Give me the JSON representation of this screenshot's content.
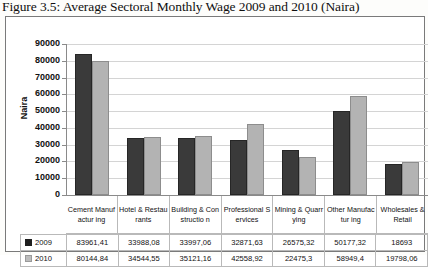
{
  "caption": "Figure 3.5: Average Sectoral Monthly Wage 2009 and 2010 (Naira)",
  "chart_data": {
    "type": "bar",
    "title": "Average Sectoral Monthly Wage 2009 and 2010 (Naira)",
    "xlabel": "",
    "ylabel": "Naira",
    "ylim": [
      0,
      90000
    ],
    "ytick_labels": [
      "90000",
      "80000",
      "70000",
      "60000",
      "50000",
      "40000",
      "30000",
      "20000",
      "10000",
      "0"
    ],
    "ytick_values": [
      90000,
      80000,
      70000,
      60000,
      50000,
      40000,
      30000,
      20000,
      10000,
      0
    ],
    "grid": "horizontal",
    "legend_position": "table-left",
    "categories": [
      "Cement Manufacturing",
      "Hotel & Restaurants",
      "Building & Construction",
      "Professional Services",
      "Mining & Quarrying",
      "Other Manufacturing",
      "Wholesales & Retail"
    ],
    "category_labels_wrapped": [
      "Cement Manufactur ing",
      "Hotel & Restaurants",
      "Building & Constructio n",
      "Professional Services",
      "Mining & Quarrying",
      "Other Manufactur ing",
      "Wholesales & Retail"
    ],
    "series": [
      {
        "name": "2009",
        "color": "#3a3a3a",
        "values": [
          83961.41,
          33988.08,
          33997.06,
          32871.63,
          26575.32,
          50177.32,
          18693
        ],
        "value_labels": [
          "83961,41",
          "33988,08",
          "33997,06",
          "32871,63",
          "26575,32",
          "50177,32",
          "18693"
        ]
      },
      {
        "name": "2010",
        "color": "#b3b3b3",
        "values": [
          80144.84,
          34544.55,
          35121.16,
          42558.92,
          22475.3,
          58949.4,
          19798.06
        ],
        "value_labels": [
          "80144,84",
          "34544,55",
          "35121,16",
          "42558,92",
          "22475,3",
          "58949,4",
          "19798,06"
        ]
      }
    ]
  }
}
